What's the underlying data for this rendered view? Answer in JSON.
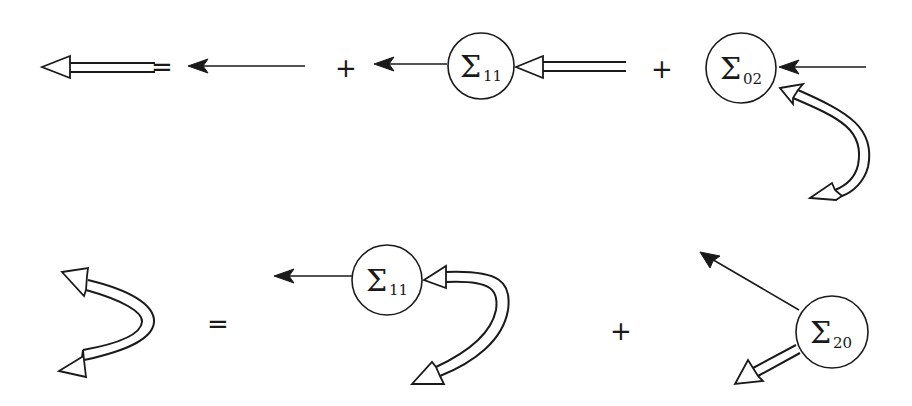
{
  "diagram": {
    "equations": [
      {
        "name": "dyson-equation-propagator",
        "lhs": "double-line-propagator",
        "equals": "=",
        "terms": [
          {
            "type": "bare-propagator"
          },
          {
            "plus": "+",
            "type": "self-energy-insertion",
            "node": {
              "symbol": "Σ",
              "subscript": "11"
            }
          },
          {
            "plus": "+",
            "type": "self-energy-insertion",
            "node": {
              "symbol": "Σ",
              "subscript": "02"
            }
          }
        ]
      },
      {
        "name": "dyson-equation-anomalous",
        "lhs": "double-line-anomalous-propagator",
        "equals": "=",
        "terms": [
          {
            "type": "self-energy-insertion",
            "node": {
              "symbol": "Σ",
              "subscript": "11"
            }
          },
          {
            "plus": "+",
            "type": "self-energy-insertion",
            "node": {
              "symbol": "Σ",
              "subscript": "20"
            }
          }
        ]
      }
    ],
    "labels": {
      "eq1_equals": "=",
      "eq1_plus1": "+",
      "eq1_plus2": "+",
      "eq2_equals": "=",
      "eq2_plus": "+",
      "sigma": "Σ",
      "node1_sub": "11",
      "node2_sub": "02",
      "node3_sub": "11",
      "node4_sub": "20"
    },
    "colors": {
      "ink": "#1a1a1a",
      "background": "#ffffff"
    }
  }
}
